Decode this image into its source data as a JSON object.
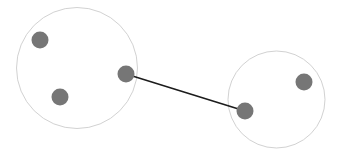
{
  "canvas": {
    "width": 338,
    "height": 160,
    "background": "#ffffff"
  },
  "diagram": {
    "type": "node-link-graph",
    "node_fill": "#767676",
    "boundary_stroke": "#d2d2d2",
    "boundary_stroke_width": 1,
    "boundary_fill": "#ffffff",
    "edge_stroke": "#1c1c1c",
    "edge_stroke_width": 1.6,
    "node_radius": 8
  },
  "clusters": [
    {
      "id": "cluster-left",
      "label": "left-cluster",
      "cx": 77,
      "cy": 68,
      "r": 60.5
    },
    {
      "id": "cluster-right",
      "label": "right-cluster",
      "cx": 276.5,
      "cy": 99.5,
      "r": 48.5
    }
  ],
  "nodes": [
    {
      "id": "n1",
      "label": "left-node-upper",
      "cluster": "cluster-left",
      "cx": 40,
      "cy": 40,
      "r": 8.5
    },
    {
      "id": "n2",
      "label": "left-node-lower",
      "cluster": "cluster-left",
      "cx": 60,
      "cy": 97,
      "r": 8.5
    },
    {
      "id": "n3",
      "label": "left-node-bridge",
      "cluster": "cluster-left",
      "cx": 126,
      "cy": 74,
      "r": 8.5
    },
    {
      "id": "n4",
      "label": "right-node-bridge",
      "cluster": "cluster-right",
      "cx": 245,
      "cy": 111,
      "r": 8.5
    },
    {
      "id": "n5",
      "label": "right-node-outer",
      "cluster": "cluster-right",
      "cx": 304,
      "cy": 82,
      "r": 8.5
    }
  ],
  "edges": [
    {
      "id": "e1",
      "label": "bridge-edge",
      "source": "n3",
      "target": "n4",
      "x1": 126,
      "y1": 74,
      "x2": 245,
      "y2": 111
    }
  ]
}
